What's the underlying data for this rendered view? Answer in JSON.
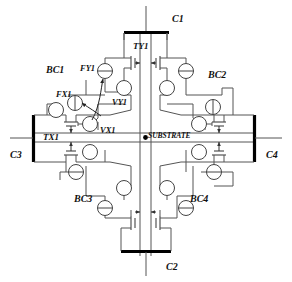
{
  "diagram": {
    "type": "circuit-schematic",
    "background": "#ffffff",
    "line_color": "#4a4a4a",
    "bold_line_color": "#000000",
    "text_color": "#111111"
  },
  "terminals": [
    {
      "id": "C1",
      "label": "C1",
      "position": "top",
      "bar": "horizontal",
      "x": 172,
      "y": 14
    },
    {
      "id": "C2",
      "label": "C2",
      "position": "bottom",
      "bar": "horizontal",
      "x": 166,
      "y": 264
    },
    {
      "id": "C3",
      "label": "C3",
      "position": "left",
      "bar": "vertical",
      "x": 10,
      "y": 152
    },
    {
      "id": "C4",
      "label": "C4",
      "position": "right",
      "bar": "vertical",
      "x": 266,
      "y": 152
    }
  ],
  "quadrant_labels": [
    {
      "id": "BC1",
      "label": "BC1",
      "x": 46,
      "y": 70,
      "quadrant": "top-left"
    },
    {
      "id": "BC2",
      "label": "BC2",
      "x": 208,
      "y": 74,
      "quadrant": "top-right"
    },
    {
      "id": "BC3",
      "label": "BC3",
      "x": 74,
      "y": 199,
      "quadrant": "bottom-left"
    },
    {
      "id": "BC4",
      "label": "BC4",
      "x": 190,
      "y": 199,
      "quadrant": "bottom-right"
    }
  ],
  "devices": [
    {
      "id": "TY1",
      "label": "TY1",
      "kind": "transmission-gate",
      "orientation": "horizontal-pair",
      "x": 133,
      "y": 46
    },
    {
      "id": "TX1",
      "label": "TX1",
      "kind": "transmission-gate",
      "orientation": "vertical-pair",
      "x": 43,
      "y": 138
    }
  ],
  "sources": [
    {
      "id": "FY1",
      "label": "FY1",
      "symbol": "current-source",
      "line": "horizontal",
      "x": 86,
      "y": 70
    },
    {
      "id": "FX1",
      "label": "FX1",
      "symbol": "current-source",
      "line": "vertical",
      "x": 62,
      "y": 95
    },
    {
      "id": "VY1",
      "label": "VY1",
      "symbol": "voltage-source",
      "line": "none",
      "x": 116,
      "y": 103
    },
    {
      "id": "VX1",
      "label": "VX1",
      "symbol": "voltage-source",
      "line": "none",
      "x": 100,
      "y": 130
    }
  ],
  "nodes": [
    {
      "id": "SUBSTRATE",
      "label": "SUBSTRATE",
      "kind": "junction-dot",
      "x": 146,
      "y": 134
    }
  ],
  "annotations": {
    "leader_arrows": [
      {
        "from": "FY1-label",
        "to": "FY1-symbol"
      },
      {
        "from": "FX1-label",
        "to": "FX1-symbol"
      }
    ]
  }
}
